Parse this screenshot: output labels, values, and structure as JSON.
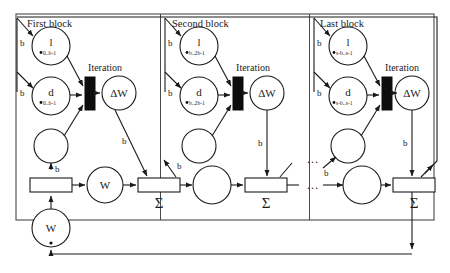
{
  "figure": {
    "blocks": [
      {
        "name": "First block",
        "input_label_top": "b",
        "input_label_bottom": "b",
        "node_top": {
          "symbol": "l",
          "subscript": "0..b-1"
        },
        "node_bottom": {
          "symbol": "d",
          "subscript": "0..b-1"
        },
        "iteration_label": "Iteration",
        "delta_label": "ΔW",
        "delta_out_label": "b",
        "sum_label": "Σ",
        "pre_sum_label": "b"
      },
      {
        "name": "Second block",
        "input_label_top": "b",
        "input_label_bottom": "b",
        "node_top": {
          "symbol": "l",
          "subscript": "b..2b-1"
        },
        "node_bottom": {
          "symbol": "d",
          "subscript": "b..2b-1"
        },
        "iteration_label": "Iteration",
        "delta_label": "ΔW",
        "delta_out_label": "b",
        "sum_label": "Σ",
        "pre_sum_label": "b"
      },
      {
        "name": "Last block",
        "input_label_top": "b",
        "input_label_bottom": "b",
        "node_top": {
          "symbol": "l",
          "subscript": "s-b..s-1"
        },
        "node_bottom": {
          "symbol": "d",
          "subscript": "s-b..s-1"
        },
        "iteration_label": "Iteration",
        "delta_label": "ΔW",
        "delta_out_label": "b",
        "sum_label": "Σ",
        "pre_sum_label": "b"
      }
    ],
    "weight_nodes": {
      "feedback_weight": "W",
      "forward_weight": "W"
    },
    "first_rect_in_label": "b",
    "ellipsis_upper": "...",
    "ellipsis_lower": "...",
    "colors": {
      "ink": "#1a1a1a",
      "frame": "#4a4a4a",
      "bar_fill": "#0d0d0d",
      "paper": "#ffffff"
    }
  }
}
